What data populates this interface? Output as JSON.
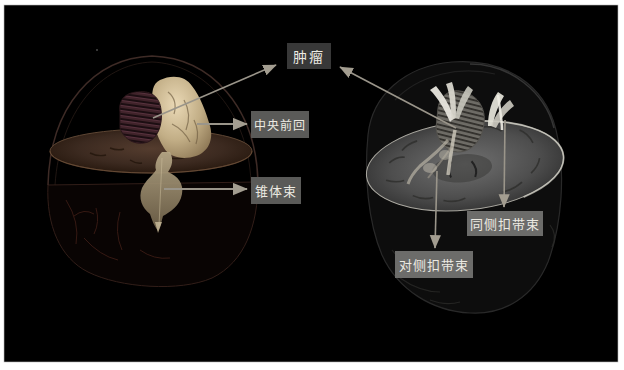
{
  "figure": {
    "views": [
      "left-3d-render-with-axial-slab",
      "right-3d-render-with-mri-slice"
    ]
  },
  "labels": {
    "tumor": "肿瘤",
    "precentral_gyrus": "中央前回",
    "pyramidal_tract": "锥体束",
    "ipsilateral_cingulum": "同侧扣带束",
    "contralateral_cingulum": "对侧扣带束"
  },
  "colors": {
    "frame": "#ffffff",
    "canvas_bg": "#000000",
    "label_text": "#eceae2",
    "label_bg_dark": "#383838",
    "label_bg_mid": "#5a5a58",
    "label_bg_light": "#6c6c6a",
    "arrow": "#9a958a",
    "tumor_maroon": "#40232a",
    "gyrus_cream": "#d9c8a6",
    "slice_brown": "#3c2a20",
    "slice_gray": "#5e5e5e",
    "tract_white": "#e6e4da"
  }
}
